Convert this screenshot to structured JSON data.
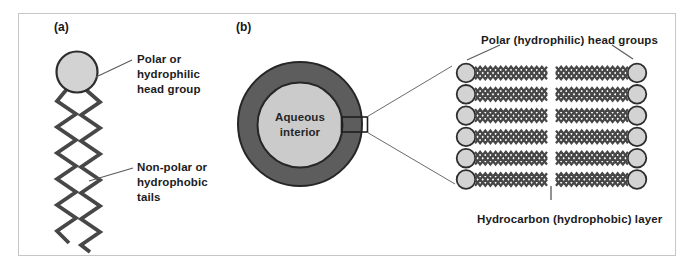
{
  "figure": {
    "panel_a": {
      "tag": "(a)",
      "head_label": "Polar or\nhydrophilic\nhead group",
      "tail_label": "Non-polar or\nhydrophobic\ntails"
    },
    "panel_b": {
      "tag": "(b)",
      "aqueous_label": "Aqueous\ninterior",
      "head_groups_label": "Polar (hydrophilic) head groups",
      "hydrocarbon_label": "Hydrocarbon (hydrophobic) layer",
      "bilayer_rows": 6,
      "lipids_per_row": 2
    },
    "colors": {
      "head_fill": "#d3d3d3",
      "head_outline": "#2d2d2d",
      "tail": "#474747",
      "vesicle_ring_fill": "#5d5d5d",
      "vesicle_ring_outline": "#262626",
      "vesicle_interior_fill": "#cbcbcb",
      "frame_border": "#c6c6c6",
      "pointer_line": "#5a5a5a",
      "text": "#1c1c1c"
    }
  }
}
